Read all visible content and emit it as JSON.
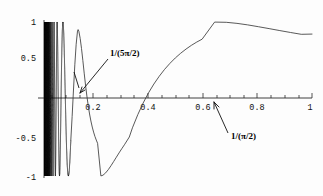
{
  "chart_data": {
    "type": "line",
    "title": "",
    "subtitle": "",
    "xlabel": "",
    "ylabel": "",
    "function": "sin(1/x)",
    "xlim": [
      0,
      1
    ],
    "ylim": [
      -1,
      1
    ],
    "grid": false,
    "legend": "none",
    "x_ticks": [
      {
        "value": 0.2,
        "label": "0.2"
      },
      {
        "value": 0.4,
        "label": "0.4"
      },
      {
        "value": 0.6,
        "label": "0.6"
      },
      {
        "value": 0.8,
        "label": "0.8"
      },
      {
        "value": 1.0,
        "label": "1"
      }
    ],
    "x_minor_tick_step": 0.05,
    "y_ticks": [
      {
        "value": 1.0,
        "label": "1"
      },
      {
        "value": 0.5,
        "label": "0.5"
      },
      {
        "value": -0.5,
        "label": "-0.5"
      },
      {
        "value": -1.0,
        "label": "-1"
      }
    ],
    "annotations": [
      {
        "id": "annot-5pi-over-2",
        "label": "1/(5π/2)",
        "point_x": 0.1273,
        "point_y": 0.0,
        "label_x": 0.285,
        "label_y": 0.7
      },
      {
        "id": "annot-pi-over-2",
        "label": "1/(π/2)",
        "point_x": 0.6366,
        "point_y": 0.0,
        "label_x": 0.695,
        "label_y": -0.42
      }
    ],
    "features": {
      "global_maximum": {
        "x": 0.6366,
        "y": 1.0
      },
      "global_minimum_visible": {
        "x": 0.2122,
        "y": -1.0
      },
      "value_at_right_edge": {
        "x": 1.0,
        "y": 0.8415
      },
      "zero_crossings_labeled": [
        0.1273,
        0.3183,
        0.6366
      ],
      "dense_oscillation_region": [
        0.0,
        0.1
      ]
    },
    "series": [
      {
        "name": "sin(1/x)",
        "color": "#3b3b3b",
        "x": [
          0.1,
          0.105,
          0.11,
          0.115,
          0.12,
          0.125,
          0.1273,
          0.13,
          0.135,
          0.14,
          0.145,
          0.15,
          0.155,
          0.16,
          0.165,
          0.17,
          0.175,
          0.18,
          0.185,
          0.19,
          0.195,
          0.2,
          0.2122,
          0.22,
          0.23,
          0.24,
          0.25,
          0.26,
          0.27,
          0.28,
          0.29,
          0.3,
          0.3183,
          0.33,
          0.35,
          0.37,
          0.39,
          0.41,
          0.43,
          0.45,
          0.47,
          0.49,
          0.51,
          0.53,
          0.55,
          0.57,
          0.59,
          0.6366,
          0.68,
          0.72,
          0.76,
          0.8,
          0.84,
          0.88,
          0.92,
          0.96,
          1.0
        ],
        "y": [
          -0.544,
          -0.238,
          0.105,
          0.437,
          0.707,
          0.881,
          0.9,
          0.88,
          0.784,
          0.65,
          0.492,
          0.327,
          0.169,
          0.026,
          -0.098,
          -0.205,
          -0.295,
          -0.372,
          -0.437,
          -0.492,
          -0.539,
          -0.581,
          -0.999,
          -0.99,
          -0.96,
          -0.918,
          -0.868,
          -0.814,
          -0.759,
          -0.704,
          -0.651,
          -0.6,
          -0.5,
          -0.382,
          -0.213,
          -0.064,
          0.068,
          0.184,
          0.286,
          0.377,
          0.456,
          0.527,
          0.589,
          0.644,
          0.693,
          0.736,
          0.774,
          0.999,
          0.996,
          0.982,
          0.962,
          0.938,
          0.913,
          0.887,
          0.862,
          0.838,
          0.841
        ]
      }
    ]
  },
  "canvas": {
    "width": 323,
    "height": 196,
    "background": "#fdfdfd",
    "axis_color": "#2a2a2a",
    "curve_color": "#3b3b3b",
    "dense_color": "#0b0b0b",
    "text_color": "#111111"
  }
}
